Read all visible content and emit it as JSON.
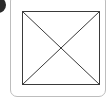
{
  "thumbnail": {
    "type": "image-placeholder",
    "icon": "broken-image-placeholder-icon",
    "colors": {
      "frame_border": "#bdbdbd",
      "placeholder_stroke": "#3a3a3a",
      "badge": "#2a2a2a",
      "background": "#ffffff"
    }
  }
}
